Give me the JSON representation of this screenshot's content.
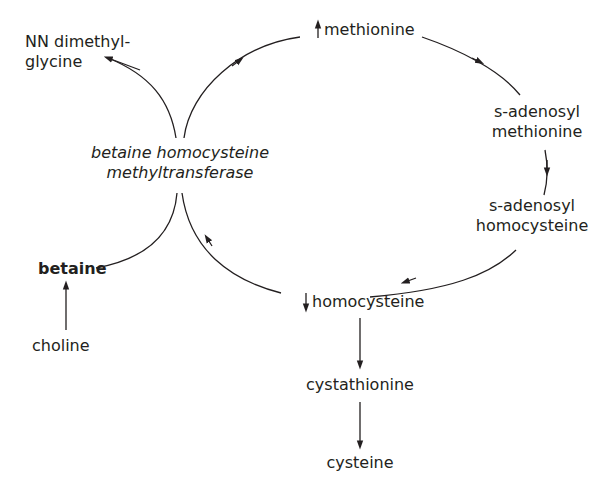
{
  "diagram": {
    "colors": {
      "line": "#231f20",
      "text": "#231f20",
      "background": "#ffffff"
    },
    "nodes": {
      "nn_dimethylglycine": {
        "line1": "NN dimethyl-",
        "line2": "glycine"
      },
      "methionine": {
        "label": "methionine",
        "indicator": "up-arrow"
      },
      "sam": {
        "line1": "s-adenosyl",
        "line2": "methionine"
      },
      "sah": {
        "line1": "s-adenosyl",
        "line2": "homocysteine"
      },
      "homocysteine": {
        "label": "homocysteine",
        "indicator": "down-arrow"
      },
      "cystathionine": {
        "label": "cystathionine"
      },
      "cysteine": {
        "label": "cysteine"
      },
      "betaine": {
        "label": "betaine"
      },
      "choline": {
        "label": "choline"
      },
      "enzyme": {
        "line1": "betaine homocysteine",
        "line2": "methyltransferase"
      }
    },
    "edges": [
      {
        "from": "enzyme",
        "to": "nn_dimethylglycine"
      },
      {
        "from": "enzyme",
        "to": "methionine"
      },
      {
        "from": "methionine",
        "to": "sam"
      },
      {
        "from": "sam",
        "to": "sah"
      },
      {
        "from": "sah",
        "to": "homocysteine"
      },
      {
        "from": "homocysteine",
        "to": "enzyme"
      },
      {
        "from": "betaine",
        "to": "enzyme"
      },
      {
        "from": "choline",
        "to": "betaine"
      },
      {
        "from": "homocysteine",
        "to": "cystathionine"
      },
      {
        "from": "cystathionine",
        "to": "cysteine"
      }
    ]
  }
}
